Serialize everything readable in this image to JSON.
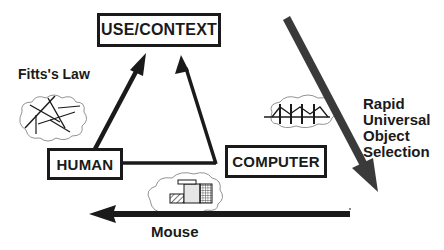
{
  "diagram": {
    "nodes": {
      "use_context": "USE/CONTEXT",
      "human": "HUMAN",
      "computer": "COMPUTER"
    },
    "annotations": {
      "fitts_law": "Fitts's Law",
      "rapid_universal_object_selection": [
        "Rapid",
        "Universal",
        "Object",
        "Selection"
      ],
      "mouse": "Mouse"
    },
    "icons": {
      "fitts_cloud": "scribble-lines-cloud-icon",
      "bridge_cloud": "bridge-cloud-icon",
      "screen_cloud": "screen-layout-cloud-icon"
    },
    "edges": [
      {
        "from": "HUMAN",
        "to": "USE/CONTEXT",
        "type": "arrow"
      },
      {
        "from": "HUMAN",
        "to": "USE/CONTEXT",
        "via": "COMPUTER-side corner",
        "type": "arrow"
      },
      {
        "from": "top-right",
        "to": "bottom-right",
        "label": "Rapid Universal Object Selection",
        "type": "large-diagonal-arrow"
      },
      {
        "from": "right",
        "to": "left",
        "label": "Mouse",
        "type": "large-horizontal-arrow"
      }
    ],
    "colors": {
      "ink": "#1a1a1a",
      "diagonal_arrow": "#3a3a3a",
      "background": "#ffffff"
    }
  }
}
